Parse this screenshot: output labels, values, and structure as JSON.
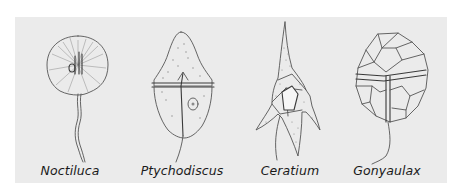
{
  "figure": {
    "background_color": "#ebebeb",
    "line_color": "#555555",
    "specimens": [
      {
        "name": "Noctiluca",
        "label": "Noctiluca",
        "shape": "round-cell-with-tentacle"
      },
      {
        "name": "Ptychodiscus",
        "label": "Ptychodiscus",
        "shape": "bicone-with-girdle"
      },
      {
        "name": "Ceratium",
        "label": "Ceratium",
        "shape": "three-horned-spiny"
      },
      {
        "name": "Gonyaulax",
        "label": "Gonyaulax",
        "shape": "polygonal-armored-plates"
      }
    ]
  }
}
